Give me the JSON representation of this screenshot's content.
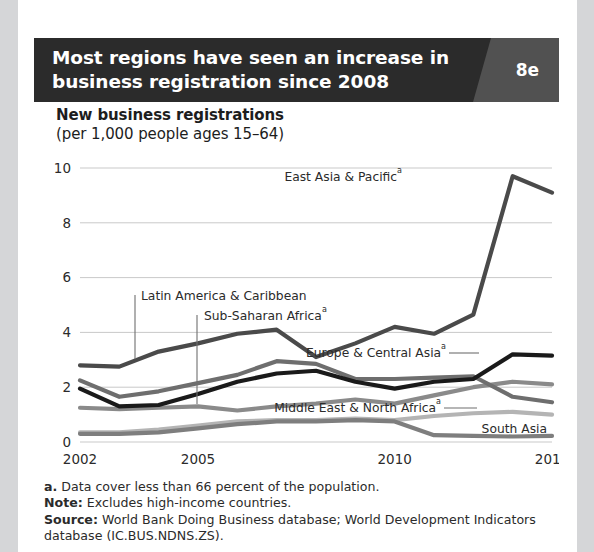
{
  "header": {
    "title": "Most regions have seen an increase in business registration since 2008",
    "badge": "8e"
  },
  "chart_title": "New business registrations",
  "chart_subtitle": "(per 1,000 people ages 15–64)",
  "notes": {
    "footnote_marker": "a.",
    "footnote_text": "Data cover less than 66 percent of the population.",
    "note_label": "Note:",
    "note_text": "Excludes high-income countries.",
    "source_label": "Source:",
    "source_text": "World Bank Doing Business database; World Development Indicators database (IC.BUS.NDNS.ZS)."
  },
  "labels": {
    "east_asia": "East Asia & Pacific",
    "east_asia_sup": "a",
    "latin_america": "Latin America & Caribbean",
    "sub_saharan": "Sub-Saharan Africa",
    "sub_saharan_sup": "a",
    "europe_central": "Europe & Central Asia",
    "europe_central_sup": "a",
    "middle_east": "Middle East & North Africa",
    "middle_east_sup": "a",
    "south_asia": "South Asia"
  },
  "axis": {
    "y_ticks": [
      "0",
      "2",
      "4",
      "6",
      "8",
      "10"
    ],
    "x_ticks": [
      "2002",
      "2005",
      "2010",
      "2014"
    ]
  },
  "colors": {
    "page_background": "#d5d6d8",
    "card_background": "#ffffff",
    "header_background": "#2b2b2b",
    "badge_background": "#515151",
    "text": "#2b2b2b",
    "gridline": "#c9c9c9",
    "east_asia": "#4a4a4a",
    "latin_america": "#6e6e6e",
    "sub_saharan": "#8a8a8a",
    "europe_central": "#1a1a1a",
    "middle_east": "#b4b4b4",
    "south_asia": "#7e7e7e"
  },
  "chart_data": {
    "type": "line",
    "title": "New business registrations (per 1,000 people ages 15–64)",
    "xlabel": "",
    "ylabel": "New business registrations (per 1,000 people ages 15–64)",
    "ylim": [
      0,
      10
    ],
    "xlim": [
      2002,
      2014
    ],
    "grid": true,
    "legend": "inline-labels",
    "x": [
      2002,
      2003,
      2004,
      2005,
      2006,
      2007,
      2008,
      2009,
      2010,
      2011,
      2012,
      2013,
      2014
    ],
    "series": [
      {
        "name": "East Asia & Pacific",
        "footnote": "a",
        "color": "#4a4a4a",
        "values": [
          2.8,
          2.75,
          3.3,
          3.6,
          3.95,
          4.1,
          3.1,
          3.6,
          4.2,
          3.95,
          4.65,
          9.7,
          9.1
        ]
      },
      {
        "name": "Latin America & Caribbean",
        "color": "#6e6e6e",
        "values": [
          2.25,
          1.65,
          1.85,
          2.15,
          2.45,
          2.95,
          2.85,
          2.3,
          2.3,
          2.35,
          2.4,
          1.65,
          1.45
        ]
      },
      {
        "name": "Sub-Saharan Africa",
        "footnote": "a",
        "color": "#8a8a8a",
        "values": [
          1.25,
          1.2,
          1.25,
          1.3,
          1.15,
          1.3,
          1.4,
          1.55,
          1.4,
          1.7,
          2.0,
          2.2,
          2.1
        ]
      },
      {
        "name": "Europe & Central Asia",
        "footnote": "a",
        "color": "#1a1a1a",
        "values": [
          1.95,
          1.3,
          1.35,
          1.75,
          2.2,
          2.5,
          2.6,
          2.2,
          1.95,
          2.2,
          2.3,
          3.2,
          3.15
        ]
      },
      {
        "name": "Middle East & North Africa",
        "footnote": "a",
        "color": "#b4b4b4",
        "values": [
          0.35,
          0.35,
          0.45,
          0.6,
          0.75,
          0.8,
          0.8,
          0.85,
          0.8,
          0.95,
          1.05,
          1.1,
          1.0
        ]
      },
      {
        "name": "South Asia",
        "color": "#7e7e7e",
        "values": [
          0.3,
          0.3,
          0.35,
          0.5,
          0.65,
          0.75,
          0.75,
          0.8,
          0.75,
          0.25,
          0.22,
          0.2,
          0.22
        ]
      }
    ]
  }
}
